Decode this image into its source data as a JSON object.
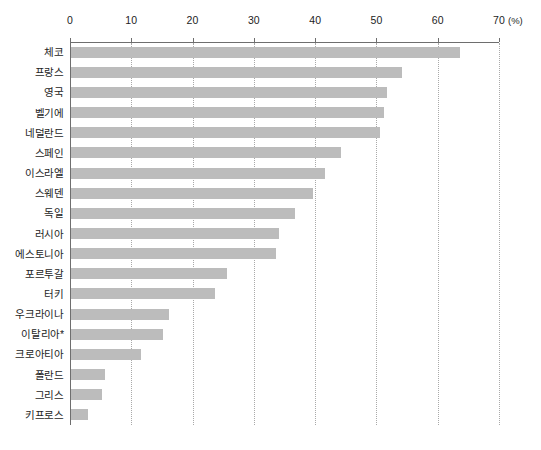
{
  "chart_data": {
    "type": "bar",
    "orientation": "horizontal",
    "title": "",
    "subtitle": "",
    "xlabel": "(%)",
    "ylabel": "",
    "xlim": [
      0,
      70
    ],
    "xticks": [
      0,
      10,
      20,
      30,
      40,
      50,
      60,
      70
    ],
    "xtick_labels": [
      "0",
      "10",
      "20",
      "30",
      "40",
      "50",
      "60",
      "70"
    ],
    "unit_label": "(%)",
    "grid": "vertical-dotted",
    "legend": "none",
    "bar_color": "#bcbcbc",
    "axis_color": "#6e6e6e",
    "gridline_color": "#a9a9a9",
    "footnote": "*",
    "categories": [
      "체코",
      "프랑스",
      "영국",
      "벨기에",
      "네덜란드",
      "스페인",
      "이스라엘",
      "스웨덴",
      "독일",
      "러시아",
      "에스토니아",
      "포르투갈",
      "터키",
      "우크라이나",
      "이탈리아*",
      "크로아티아",
      "폴란드",
      "그리스",
      "키프로스"
    ],
    "values": [
      63.5,
      54.0,
      51.5,
      51.0,
      50.5,
      44.0,
      41.5,
      39.5,
      36.5,
      34.0,
      33.5,
      25.5,
      23.5,
      16.0,
      15.0,
      11.5,
      5.5,
      5.0,
      2.8
    ]
  }
}
